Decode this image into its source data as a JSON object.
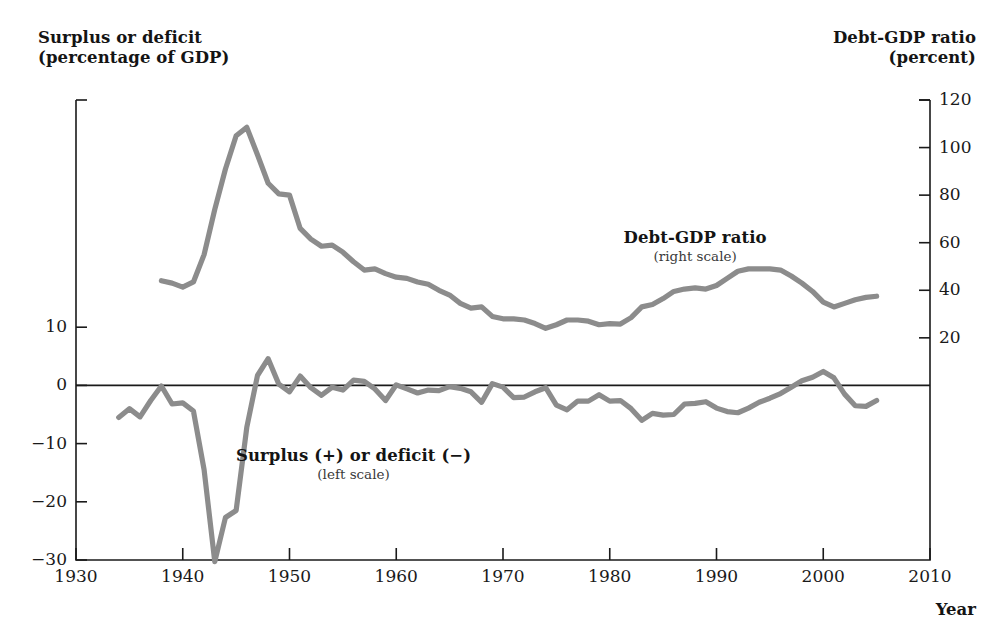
{
  "figure": {
    "left_axis_title_line1": "Surplus or deficit",
    "left_axis_title_line2": "(percentage of GDP)",
    "right_axis_title_line1": "Debt-GDP ratio",
    "right_axis_title_line2": "(percent)",
    "x_axis_name": "Year",
    "series_color": "#8c8c8c",
    "axis_color": "#1a1a1a"
  },
  "annotations": {
    "debt": {
      "label": "Debt-GDP ratio",
      "scale_note": "(right scale)"
    },
    "deficit": {
      "label": "Surplus (+) or deficit (−)",
      "scale_note": "(left scale)"
    }
  },
  "chart_data": {
    "type": "line",
    "title": "",
    "xlabel": "Year",
    "grid": false,
    "legend": "inline-annotations",
    "xlim": [
      1930,
      2010
    ],
    "xticks": [
      1930,
      1940,
      1950,
      1960,
      1970,
      1980,
      1990,
      2000,
      2010
    ],
    "left_axis": {
      "label_line1": "Surplus or deficit",
      "label_line2": "(percentage of GDP)",
      "ylim": [
        -30,
        39
      ],
      "yticks": [
        10,
        0,
        -10,
        -20,
        -30
      ],
      "ytick_labels": [
        "10",
        "0",
        "−10",
        "−20",
        "−30"
      ]
    },
    "right_axis": {
      "label_line1": "Debt-GDP ratio",
      "label_line2": "(percent)",
      "ylim": [
        0,
        120
      ],
      "yticks": [
        120,
        100,
        80,
        60,
        40,
        20
      ],
      "ytick_labels": [
        "120",
        "100",
        "80",
        "60",
        "40",
        "20"
      ]
    },
    "series": [
      {
        "name": "Debt-GDP ratio",
        "scale": "right",
        "color": "#8c8c8c",
        "annotation": "Debt-GDP ratio (right scale)",
        "x": [
          1938,
          1939,
          1940,
          1941,
          1942,
          1943,
          1944,
          1945,
          1946,
          1947,
          1948,
          1949,
          1950,
          1951,
          1952,
          1953,
          1954,
          1955,
          1956,
          1957,
          1958,
          1959,
          1960,
          1961,
          1962,
          1963,
          1964,
          1965,
          1966,
          1967,
          1968,
          1969,
          1970,
          1971,
          1972,
          1973,
          1974,
          1975,
          1976,
          1977,
          1978,
          1979,
          1980,
          1981,
          1982,
          1983,
          1984,
          1985,
          1986,
          1987,
          1988,
          1989,
          1990,
          1991,
          1992,
          1993,
          1994,
          1995,
          1996,
          1997,
          1998,
          1999,
          2000,
          2001,
          2002,
          2003,
          2004,
          2005
        ],
        "values": [
          44.0,
          43.0,
          41.3,
          43.5,
          55.0,
          74.0,
          91.0,
          105.0,
          108.5,
          97.0,
          85.0,
          80.5,
          80.0,
          66.0,
          61.5,
          58.5,
          59.0,
          56.0,
          52.0,
          48.5,
          49.0,
          47.0,
          45.5,
          45.0,
          43.5,
          42.5,
          40.0,
          38.0,
          34.5,
          32.5,
          33.0,
          29.0,
          28.0,
          28.0,
          27.5,
          26.0,
          24.0,
          25.5,
          27.5,
          27.5,
          27.0,
          25.5,
          26.0,
          25.8,
          28.5,
          33.0,
          34.0,
          36.5,
          39.5,
          40.5,
          41.0,
          40.5,
          42.0,
          45.0,
          48.0,
          49.0,
          49.0,
          49.0,
          48.5,
          46.0,
          43.0,
          39.5,
          35.0,
          33.0,
          34.5,
          36.0,
          37.0,
          37.5
        ]
      },
      {
        "name": "Surplus (+) or deficit (−)",
        "scale": "left",
        "color": "#8c8c8c",
        "annotation": "Surplus (+) or deficit (−) (left scale)",
        "x": [
          1934,
          1935,
          1936,
          1937,
          1938,
          1939,
          1940,
          1941,
          1942,
          1943,
          1944,
          1945,
          1946,
          1947,
          1948,
          1949,
          1950,
          1951,
          1952,
          1953,
          1954,
          1955,
          1956,
          1957,
          1958,
          1959,
          1960,
          1961,
          1962,
          1963,
          1964,
          1965,
          1966,
          1967,
          1968,
          1969,
          1970,
          1971,
          1972,
          1973,
          1974,
          1975,
          1976,
          1977,
          1978,
          1979,
          1980,
          1981,
          1982,
          1983,
          1984,
          1985,
          1986,
          1987,
          1988,
          1989,
          1990,
          1991,
          1992,
          1993,
          1994,
          1995,
          1996,
          1997,
          1998,
          1999,
          2000,
          2001,
          2002,
          2003,
          2004,
          2005
        ],
        "values": [
          -5.5,
          -4.0,
          -5.4,
          -2.6,
          -0.1,
          -3.2,
          -3.0,
          -4.4,
          -14.5,
          -30.3,
          -22.7,
          -21.5,
          -7.2,
          1.7,
          4.6,
          0.2,
          -1.1,
          1.6,
          -0.4,
          -1.7,
          -0.3,
          -0.8,
          0.9,
          0.7,
          -0.6,
          -2.6,
          0.1,
          -0.6,
          -1.3,
          -0.8,
          -0.9,
          -0.2,
          -0.5,
          -1.1,
          -2.9,
          0.3,
          -0.3,
          -2.1,
          -2.0,
          -1.1,
          -0.4,
          -3.4,
          -4.2,
          -2.7,
          -2.7,
          -1.6,
          -2.7,
          -2.6,
          -4.0,
          -6.0,
          -4.8,
          -5.1,
          -5.0,
          -3.2,
          -3.1,
          -2.8,
          -3.9,
          -4.5,
          -4.7,
          -3.9,
          -2.9,
          -2.2,
          -1.4,
          -0.3,
          0.8,
          1.4,
          2.4,
          1.3,
          -1.5,
          -3.5,
          -3.6,
          -2.6
        ]
      }
    ]
  },
  "tick_labels": {
    "x": [
      "1930",
      "1940",
      "1950",
      "1960",
      "1970",
      "1980",
      "1990",
      "2000",
      "2010"
    ],
    "left": [
      "10",
      "0",
      "−10",
      "−20",
      "−30"
    ],
    "right": [
      "120",
      "100",
      "80",
      "60",
      "40",
      "20"
    ]
  }
}
